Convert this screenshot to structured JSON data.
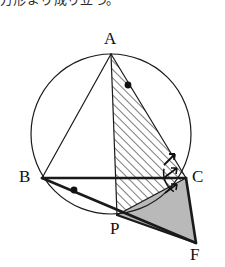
{
  "page": {
    "cut_off_text": "方形より成り立つ。",
    "background_color": "#ffffff",
    "ink_color": "#1a1a1a"
  },
  "figure": {
    "type": "geometry-diagram",
    "circle": {
      "cx": 111,
      "cy": 134,
      "r": 80,
      "stroke": "#1a1a1a",
      "stroke_width": 1.2
    },
    "points": [
      {
        "id": "A",
        "x": 111,
        "y": 54,
        "label": "A",
        "label_x": 104,
        "label_y": 30
      },
      {
        "id": "B",
        "x": 42,
        "y": 178,
        "label": "B",
        "label_x": 19,
        "label_y": 168
      },
      {
        "id": "C",
        "x": 186,
        "y": 178,
        "label": "C",
        "label_x": 192,
        "label_y": 168
      },
      {
        "id": "P",
        "x": 117,
        "y": 215,
        "label": "P",
        "label_x": 110,
        "label_y": 220
      },
      {
        "id": "F",
        "x": 196,
        "y": 243,
        "label": "F",
        "label_x": 190,
        "label_y": 246
      }
    ],
    "segments": [
      {
        "name": "AB",
        "from": "A",
        "to": "B",
        "width": 1.2
      },
      {
        "name": "AC",
        "from": "A",
        "to": "C",
        "width": 1.2
      },
      {
        "name": "AP",
        "from": "A",
        "to": "P",
        "width": 1.2
      },
      {
        "name": "BC",
        "from": "B",
        "to": "C",
        "width": 2.6
      },
      {
        "name": "BF",
        "from": "B",
        "to": "F",
        "width": 2.6
      },
      {
        "name": "PC",
        "from": "P",
        "to": "C",
        "width": 1.4
      },
      {
        "name": "CF",
        "from": "C",
        "to": "F",
        "width": 2.6
      },
      {
        "name": "PF",
        "from": "P",
        "to": "F",
        "width": 2.2
      }
    ],
    "regions": [
      {
        "name": "triangle-APC",
        "fill": "hatch",
        "vertices": [
          "A",
          "P",
          "C"
        ]
      },
      {
        "name": "triangle-PCF",
        "fill": "gray",
        "fill_color": "#b9b9b9",
        "vertices": [
          "P",
          "C",
          "F"
        ]
      }
    ],
    "markers": [
      {
        "name": "angle-dot-at-A",
        "type": "dot",
        "x": 128,
        "y": 85,
        "r": 3.4
      },
      {
        "name": "angle-dot-at-B",
        "type": "dot",
        "x": 74,
        "y": 190,
        "r": 3.4
      },
      {
        "name": "tick-above-C",
        "type": "double-tick",
        "x": 169,
        "y": 159
      },
      {
        "name": "angle-arc-at-C",
        "type": "arc",
        "cx": 186,
        "cy": 178,
        "r": 22
      },
      {
        "name": "arrow-tick-upper-C",
        "type": "arrow-tick",
        "x": 172,
        "y": 172
      },
      {
        "name": "arrow-tick-lower-C",
        "type": "arrow-tick",
        "x": 172,
        "y": 188
      }
    ]
  }
}
